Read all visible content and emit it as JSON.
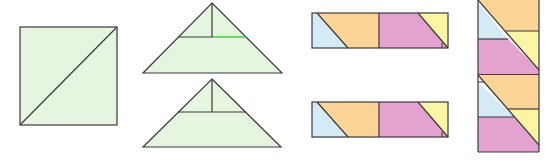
{
  "colors": {
    "green": "#e6f5e0",
    "blue": "#d4ebf7",
    "orange": "#fbd596",
    "pink": "#e3a2cf",
    "yellow": "#fbf5a4",
    "stroke": "#3a3a3a",
    "highlight": "#3ccf3c"
  },
  "figures": [
    {
      "id": "square",
      "description": "Square divided by diagonal"
    },
    {
      "id": "triangle-top",
      "description": "Triangle with horizontal and vertical cut, green highlighted segment"
    },
    {
      "id": "triangle-bottom",
      "description": "Triangle with horizontal and vertical cut"
    },
    {
      "id": "strip-top",
      "description": "Horizontal strip with blue, orange, pink, yellow pieces"
    },
    {
      "id": "strip-bottom",
      "description": "Horizontal strip with blue, orange, pink, yellow pieces"
    },
    {
      "id": "column",
      "description": "Vertical column of stacked colored pieces"
    }
  ]
}
